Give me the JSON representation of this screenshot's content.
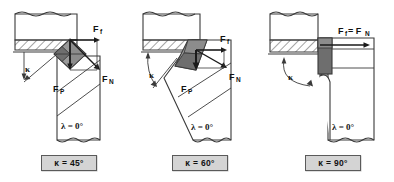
{
  "figure": {
    "panel_count": 3
  },
  "colors": {
    "outline": "#3a3a3a",
    "hatch": "#4a4a4a",
    "insert_light": "#9a9a9a",
    "insert_dark": "#6e6e6e",
    "caption_bg": "#d4d4d4",
    "caption_border": "#5a5a5a",
    "text": "#111111",
    "background": "#ffffff"
  },
  "panels": [
    {
      "id": "panel-45",
      "caption": "κ = 45°",
      "lead_angle_value": "45°",
      "lead_angle_symbol": "κ",
      "inclination_label": "λ = 0°",
      "inclination_symbol": "λ",
      "inclination_value": "0°",
      "angle_marker": "κ",
      "force_labels": {
        "feed": "F",
        "feed_sub": "f",
        "normal": "F",
        "normal_sub": "N",
        "passive": "F",
        "passive_sub": "P"
      },
      "parts": {
        "workpiece": "workpiece",
        "machined_surface": "hatched-machined-layer",
        "tool_shank": "tool-shank",
        "insert": "cutting-insert"
      }
    },
    {
      "id": "panel-60",
      "caption": "κ = 60°",
      "lead_angle_value": "60°",
      "lead_angle_symbol": "κ",
      "inclination_label": "λ = 0°",
      "inclination_symbol": "λ",
      "inclination_value": "0°",
      "angle_marker": "κ",
      "force_labels": {
        "feed": "F",
        "feed_sub": "f",
        "normal": "F",
        "normal_sub": "N",
        "passive": "F",
        "passive_sub": "P"
      },
      "parts": {
        "workpiece": "workpiece",
        "machined_surface": "hatched-machined-layer",
        "tool_shank": "tool-shank",
        "insert": "cutting-insert"
      }
    },
    {
      "id": "panel-90",
      "caption": "κ = 90°",
      "lead_angle_value": "90°",
      "lead_angle_symbol": "κ",
      "inclination_label": "λ = 0°",
      "inclination_symbol": "λ",
      "inclination_value": "0°",
      "angle_marker": "κ",
      "force_labels": {
        "combined": "F",
        "combined_sub_1": "f",
        "combined_eq": " = F",
        "combined_sub_2": "N"
      },
      "parts": {
        "workpiece": "workpiece",
        "machined_surface": "hatched-machined-layer",
        "tool_shank": "tool-shank",
        "insert": "cutting-insert"
      }
    }
  ]
}
